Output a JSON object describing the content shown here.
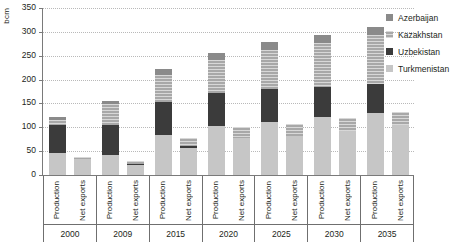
{
  "chart_data": {
    "type": "bar",
    "stacked": true,
    "title": "",
    "subtitle": "",
    "xlabel": "",
    "ylabel": "bcm",
    "ylim": [
      0,
      350
    ],
    "yticks": [
      0,
      50,
      100,
      150,
      200,
      250,
      300,
      350
    ],
    "grid": true,
    "legend_position": "top-right",
    "categories": [
      "2000",
      "2009",
      "2015",
      "2020",
      "2025",
      "2030",
      "2035"
    ],
    "subcategories": [
      "Production",
      "Net exports"
    ],
    "series": [
      {
        "name": "Azerbaijan",
        "color": "#8a8a8a",
        "values": {
          "Production": [
            7,
            8,
            13,
            14,
            16,
            17,
            18
          ],
          "Net exports": [
            0,
            0,
            0,
            0,
            0,
            0,
            0
          ]
        }
      },
      {
        "name": "Kazakhstan",
        "color": "#a8a8a8",
        "values": {
          "Production": [
            10,
            43,
            55,
            70,
            82,
            93,
            103
          ],
          "Net exports": [
            4,
            6,
            17,
            24,
            25,
            27,
            28
          ]
        }
      },
      {
        "name": "Uzbekistan",
        "color": "#3b3b3b",
        "values": {
          "Production": [
            58,
            63,
            71,
            70,
            68,
            62,
            60
          ],
          "Net exports": [
            0,
            3,
            4,
            0,
            0,
            0,
            0
          ]
        }
      },
      {
        "name": "Turkmenistan",
        "color": "#c6c6c6",
        "values": {
          "Production": [
            47,
            42,
            83,
            102,
            112,
            122,
            130
          ],
          "Net exports": [
            33,
            21,
            57,
            77,
            82,
            92,
            105
          ]
        }
      }
    ],
    "totals": {
      "Production": [
        122,
        156,
        222,
        256,
        278,
        294,
        311
      ],
      "Net exports": [
        37,
        30,
        78,
        101,
        107,
        119,
        133
      ]
    }
  },
  "axes": {
    "y_unit_label": "bcm",
    "y_tick_labels": [
      "350",
      "300",
      "250",
      "200",
      "150",
      "100",
      "50",
      "0"
    ]
  },
  "legend": {
    "items": [
      {
        "label": "Azerbaijan",
        "color": "#8a8a8a"
      },
      {
        "label": "Kazakhstan",
        "color": "#a8a8a8"
      },
      {
        "label": "Uzbekistan",
        "color": "#3b3b3b"
      },
      {
        "label": "Turkmenistan",
        "color": "#c6c6c6"
      }
    ]
  },
  "x_groups": [
    {
      "year": "2000",
      "series": [
        "Production",
        "Net exports"
      ]
    },
    {
      "year": "2009",
      "series": [
        "Production",
        "Net exports"
      ]
    },
    {
      "year": "2015",
      "series": [
        "Production",
        "Net exports"
      ]
    },
    {
      "year": "2020",
      "series": [
        "Production",
        "Net exports"
      ]
    },
    {
      "year": "2025",
      "series": [
        "Production",
        "Net exports"
      ]
    },
    {
      "year": "2030",
      "series": [
        "Production",
        "Net exports"
      ]
    },
    {
      "year": "2035",
      "series": [
        "Production",
        "Net exports"
      ]
    }
  ]
}
